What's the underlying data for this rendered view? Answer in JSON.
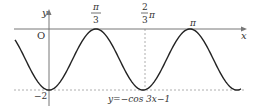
{
  "chart_data": {
    "type": "line",
    "title": "",
    "equation": "y=−cos 3x−1",
    "xlabel": "x",
    "ylabel": "y",
    "origin_label": "O",
    "x_ticks": [
      {
        "value": 1.0472,
        "label_num": "π",
        "label_den": "3"
      },
      {
        "value": 2.0944,
        "label_coef_num": "2",
        "label_coef_den": "3",
        "label_suffix": "π"
      },
      {
        "value": 3.1416,
        "label": "π"
      }
    ],
    "y_ticks": [
      {
        "value": -2,
        "label": "−2"
      }
    ],
    "function": "-cos(3x)-1",
    "xlim": [
      -0.75,
      4.3
    ],
    "ylim": [
      -2.3,
      0.6
    ],
    "series": [
      {
        "name": "y=−cos 3x−1",
        "x": [
          -0.698,
          0,
          1.0472,
          2.0944,
          3.1416,
          4.2
        ],
        "values": [
          -0.5,
          -2,
          0,
          -2,
          0,
          -1.9
        ]
      }
    ],
    "guides": [
      "dashed horizontal at y=-2",
      "dashed vertical at x=2π/3"
    ],
    "grid": false,
    "legend": "none"
  }
}
